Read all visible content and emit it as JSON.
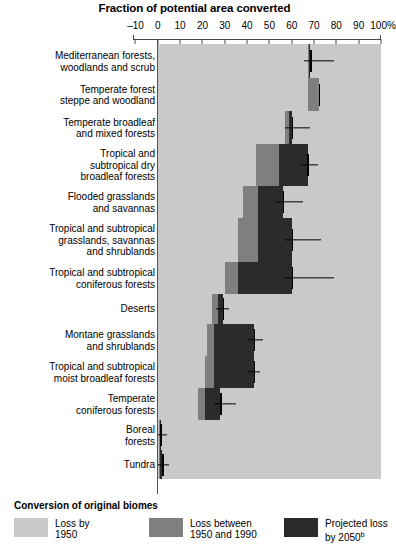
{
  "chart_data": {
    "type": "bar",
    "title": "Fraction of potential area converted",
    "xlabel": "",
    "ylabel": "",
    "orientation": "horizontal",
    "stacked": true,
    "xlim": [
      -10,
      100
    ],
    "xticks": [
      -10,
      0,
      10,
      20,
      30,
      40,
      50,
      60,
      70,
      80,
      90,
      100
    ],
    "xticklabels": [
      "–10",
      "0",
      "10",
      "20",
      "30",
      "40",
      "50",
      "60",
      "70",
      "80",
      "90",
      "100%"
    ],
    "grid": false,
    "legend_position": "bottom",
    "legend_title": "Conversion of original biomes",
    "series": [
      {
        "name": "Loss by 1950",
        "color": "#c9c9c9"
      },
      {
        "name": "Loss between 1950 and 1990",
        "color": "#7f7f7f"
      },
      {
        "name": "Projected loss by 2050",
        "color": "#2b2b2b"
      }
    ],
    "categories": [
      "Mediterranean forests, woodlands and scrub",
      "Temperate forest steppe and woodland",
      "Temperate broadleaf and mixed forests",
      "Tropical and subtropical dry broadleaf forests",
      "Flooded grasslands and savannas",
      "Tropical and subtropical grasslands, savannas and shrublands",
      "Tropical and subtropical coniferous forests",
      "Deserts",
      "Montane grasslands and shrublands",
      "Tropical and subtropical moist broadleaf forests",
      "Temperate coniferous forests",
      "Boreal forests",
      "Tundra"
    ],
    "rows": [
      {
        "label": "Mediterranean forests,\nwoodlands and scrub",
        "loss_1950": 67,
        "loss_1950_1990": 0.8,
        "projected_2050": 0.5,
        "whisker_to": 79
      },
      {
        "label": "Temperate forest\nsteppe and woodland",
        "loss_1950": 67,
        "loss_1950_1990": 5,
        "projected_2050": 0,
        "whisker_to": 72
      },
      {
        "label": "Temperate broadleaf\nand mixed forests",
        "loss_1950": 57,
        "loss_1950_1990": 1.5,
        "projected_2050": 1.5,
        "whisker_to": 68
      },
      {
        "label": "Tropical and\nsubtropical dry\nbroadleaf forests",
        "loss_1950": 44,
        "loss_1950_1990": 10,
        "projected_2050": 13,
        "whisker_to": 72
      },
      {
        "label": "Flooded grasslands\nand savannas",
        "loss_1950": 38,
        "loss_1950_1990": 7,
        "projected_2050": 11,
        "whisker_to": 65
      },
      {
        "label": "Tropical and subtropical\ngrasslands, savannas\nand shrublands",
        "loss_1950": 36,
        "loss_1950_1990": 9,
        "projected_2050": 15,
        "whisker_to": 73
      },
      {
        "label": "Tropical and subtropical\nconiferous forests",
        "loss_1950": 30,
        "loss_1950_1990": 6,
        "projected_2050": 24,
        "whisker_to": 79
      },
      {
        "label": "Deserts",
        "loss_1950": 24,
        "loss_1950_1990": 3,
        "projected_2050": 2,
        "whisker_to": 32
      },
      {
        "label": "Montane grasslands\nand shrublands",
        "loss_1950": 22,
        "loss_1950_1990": 3,
        "projected_2050": 18,
        "whisker_to": 47
      },
      {
        "label": "Tropical and subtropical\nmoist broadleaf forests",
        "loss_1950": 21,
        "loss_1950_1990": 4,
        "projected_2050": 18,
        "whisker_to": 46
      },
      {
        "label": "Temperate\nconiferous forests",
        "loss_1950": 18,
        "loss_1950_1990": 3,
        "projected_2050": 7,
        "whisker_to": 35
      },
      {
        "label": "Boreal\nforests",
        "loss_1950": 0.4,
        "loss_1950_1990": 0.4,
        "projected_2050": 0.4,
        "whisker_to": 4
      },
      {
        "label": "Tundra",
        "loss_1950": 0.4,
        "loss_1950_1990": 0.4,
        "projected_2050": 1.2,
        "whisker_to": 5
      }
    ]
  },
  "legend": {
    "title": "Conversion of original biomes",
    "items": [
      {
        "label": "Loss by\n1950",
        "color": "#c9c9c9"
      },
      {
        "label": "Loss between\n1950 and 1990",
        "color": "#7f7f7f"
      },
      {
        "label": "Projected loss\nby 2050",
        "color": "#2b2b2b",
        "superscript": "b"
      }
    ]
  }
}
